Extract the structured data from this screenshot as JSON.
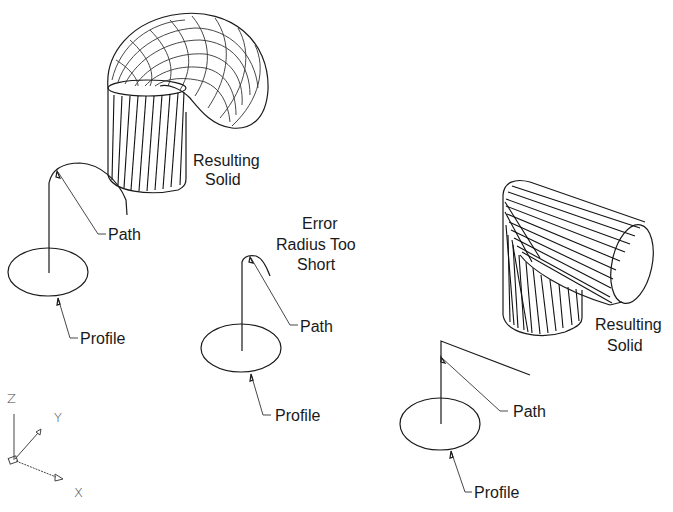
{
  "figure": {
    "examples": [
      {
        "id": "example-1",
        "labels": {
          "path": "Path",
          "profile": "Profile",
          "result_line1": "Resulting",
          "result_line2": "Solid"
        }
      },
      {
        "id": "example-2",
        "labels": {
          "error_line1": "Error",
          "error_line2": "Radius Too",
          "error_line3": "Short",
          "path": "Path",
          "profile": "Profile"
        }
      },
      {
        "id": "example-3",
        "labels": {
          "path": "Path",
          "profile": "Profile",
          "result_line1": "Resulting",
          "result_line2": "Solid"
        }
      }
    ],
    "ucs_icon": {
      "z": "Z",
      "y": "Y",
      "x": "X"
    }
  },
  "colors": {
    "ink": "#1a1a1a",
    "background": "#ffffff"
  }
}
